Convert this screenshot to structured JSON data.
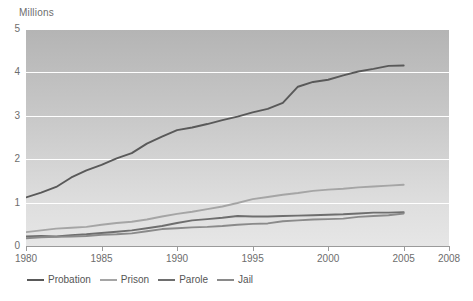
{
  "axis": {
    "units_label": "Millions",
    "y_ticks": [
      "5",
      "4",
      "3",
      "2",
      "1",
      "0"
    ],
    "x_ticks": [
      "1980",
      "1985",
      "1990",
      "1995",
      "2000",
      "2005",
      "2008"
    ]
  },
  "legend": {
    "items": [
      {
        "label": "Probation",
        "color": "#595959"
      },
      {
        "label": "Prison",
        "color": "#a5a5a5"
      },
      {
        "label": "Parole",
        "color": "#6e6e6e"
      },
      {
        "label": "Jail",
        "color": "#8a8a8a"
      }
    ]
  },
  "chart_data": {
    "type": "line",
    "title": "",
    "subtitle": "",
    "xlabel": "",
    "ylabel": "Millions",
    "xlim": [
      1980,
      2008
    ],
    "ylim": [
      0,
      5
    ],
    "grid": true,
    "gridlines_y": [
      0,
      1,
      2,
      3,
      4,
      5
    ],
    "legend_position": "bottom-left",
    "x": [
      1980,
      1981,
      1982,
      1983,
      1984,
      1985,
      1986,
      1987,
      1988,
      1989,
      1990,
      1991,
      1992,
      1993,
      1994,
      1995,
      1996,
      1997,
      1998,
      1999,
      2000,
      2001,
      2002,
      2003,
      2004,
      2005
    ],
    "series": [
      {
        "name": "Probation",
        "color": "#595959",
        "values": [
          1.12,
          1.23,
          1.36,
          1.58,
          1.74,
          1.87,
          2.02,
          2.14,
          2.36,
          2.52,
          2.67,
          2.73,
          2.81,
          2.9,
          2.98,
          3.08,
          3.16,
          3.3,
          3.67,
          3.78,
          3.83,
          3.93,
          4.02,
          4.08,
          4.15,
          4.16
        ]
      },
      {
        "name": "Prison",
        "color": "#a5a5a5",
        "values": [
          0.32,
          0.36,
          0.4,
          0.42,
          0.44,
          0.49,
          0.53,
          0.56,
          0.61,
          0.68,
          0.74,
          0.79,
          0.85,
          0.91,
          0.99,
          1.08,
          1.13,
          1.18,
          1.22,
          1.27,
          1.3,
          1.32,
          1.35,
          1.37,
          1.39,
          1.41
        ]
      },
      {
        "name": "Parole",
        "color": "#6e6e6e",
        "values": [
          0.22,
          0.23,
          0.22,
          0.25,
          0.27,
          0.3,
          0.33,
          0.36,
          0.41,
          0.46,
          0.53,
          0.59,
          0.62,
          0.65,
          0.69,
          0.68,
          0.68,
          0.69,
          0.7,
          0.71,
          0.72,
          0.73,
          0.75,
          0.77,
          0.77,
          0.78
        ]
      },
      {
        "name": "Jail",
        "color": "#8a8a8a",
        "values": [
          0.18,
          0.2,
          0.21,
          0.22,
          0.23,
          0.26,
          0.27,
          0.29,
          0.34,
          0.39,
          0.41,
          0.43,
          0.44,
          0.46,
          0.49,
          0.51,
          0.52,
          0.57,
          0.59,
          0.61,
          0.62,
          0.63,
          0.67,
          0.69,
          0.71,
          0.75
        ]
      }
    ]
  }
}
